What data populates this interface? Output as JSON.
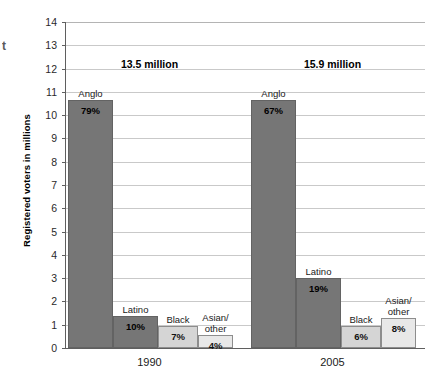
{
  "edge_fragment": "t",
  "chart_data": {
    "type": "bar",
    "title": "",
    "xlabel": "",
    "ylabel": "Registered voters in millions",
    "ylim": [
      0,
      14
    ],
    "ytick_step": 1,
    "ytick_labels": [
      "0",
      "1",
      "2",
      "3",
      "4",
      "5",
      "6",
      "7",
      "8",
      "9",
      "10",
      "11",
      "12",
      "13",
      "14"
    ],
    "grid": true,
    "legend": "none",
    "categories": [
      "1990",
      "2005"
    ],
    "group_annotations": [
      "13.5 million",
      "15.9 million"
    ],
    "series": [
      {
        "name": "Anglo",
        "color": "#767676",
        "shade": "dark",
        "values": [
          10.65,
          10.65
        ],
        "labels": [
          "79%",
          "67%"
        ]
      },
      {
        "name": "Latino",
        "color": "#767676",
        "shade": "dark",
        "values": [
          1.37,
          3.0
        ],
        "labels": [
          "10%",
          "19%"
        ]
      },
      {
        "name": "Black",
        "color": "#d5d5d5",
        "shade": "mid",
        "values": [
          0.95,
          0.95
        ],
        "labels": [
          "7%",
          "6%"
        ]
      },
      {
        "name": "Asian/\nother",
        "color": "#e8e8e8",
        "shade": "light",
        "values": [
          0.55,
          1.3
        ],
        "labels": [
          "4%",
          "8%"
        ]
      }
    ]
  }
}
